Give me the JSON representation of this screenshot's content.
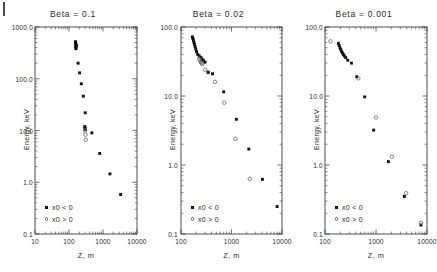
{
  "figure": {
    "panel_count": 3,
    "background": "#ffffff",
    "marker_colors": {
      "filled": "#111111",
      "open": "#5a5a5a"
    }
  },
  "chart_data": [
    {
      "type": "scatter",
      "title": "Beta = 0.1",
      "xlabel": "Z, m",
      "ylabel": "Energy, keV",
      "xscale": "log",
      "yscale": "log",
      "xlim": [
        10,
        10000
      ],
      "ylim": [
        0.1,
        1000.0
      ],
      "xticks": [
        10,
        100,
        1000,
        10000
      ],
      "xticklabels": [
        "10",
        "100",
        "1000",
        "10000"
      ],
      "yticks": [
        0.1,
        1.0,
        10.0,
        100.0,
        1000.0
      ],
      "yticklabels": [
        "0.1",
        "1.0",
        "10.0",
        "100.0",
        "1000.0"
      ],
      "grid": false,
      "legend_position": "lower left",
      "series": [
        {
          "name": "x0 < 0",
          "marker": "filled-square",
          "points": [
            [
              155,
              520
            ],
            [
              158,
              480
            ],
            [
              160,
              450
            ],
            [
              157,
              420
            ],
            [
              162,
              400
            ],
            [
              159,
              380
            ],
            [
              165,
              440
            ],
            [
              156,
              500
            ],
            [
              185,
              200
            ],
            [
              205,
              130
            ],
            [
              230,
              80
            ],
            [
              265,
              46
            ],
            [
              300,
              22
            ],
            [
              290,
              12
            ],
            [
              295,
              11
            ],
            [
              300,
              10.5
            ],
            [
              470,
              9.0
            ],
            [
              800,
              3.6
            ],
            [
              1600,
              1.45
            ],
            [
              3300,
              0.58
            ]
          ]
        },
        {
          "name": "x0 > 0",
          "marker": "open-circle",
          "points": [
            [
              295,
              11.5
            ],
            [
              298,
              10.0
            ],
            [
              305,
              8.3
            ],
            [
              312,
              6.6
            ]
          ]
        }
      ]
    },
    {
      "type": "scatter",
      "title": "Beta = 0.02",
      "xlabel": "Z, m",
      "ylabel": "Energy, keV",
      "xscale": "log",
      "yscale": "log",
      "xlim": [
        100,
        10000
      ],
      "ylim": [
        0.1,
        100.0
      ],
      "xticks": [
        100,
        1000,
        10000
      ],
      "xticklabels": [
        "100",
        "1000",
        "10000"
      ],
      "yticks": [
        0.1,
        1.0,
        10.0,
        100.0
      ],
      "yticklabels": [
        "0.1",
        "1.0",
        "10.0",
        "100.0"
      ],
      "grid": false,
      "legend_position": "lower left",
      "series": [
        {
          "name": "x0 < 0",
          "marker": "filled-square",
          "points": [
            [
              168,
              72
            ],
            [
              172,
              68
            ],
            [
              176,
              64
            ],
            [
              180,
              60
            ],
            [
              185,
              56
            ],
            [
              190,
              52
            ],
            [
              196,
              48
            ],
            [
              203,
              44
            ],
            [
              215,
              40
            ],
            [
              230,
              38
            ],
            [
              250,
              36
            ],
            [
              258,
              34
            ],
            [
              277,
              33
            ],
            [
              300,
              31
            ],
            [
              350,
              22
            ],
            [
              420,
              21
            ],
            [
              700,
              11.5
            ],
            [
              1250,
              4.6
            ],
            [
              2200,
              1.7
            ],
            [
              4100,
              0.62
            ],
            [
              8000,
              0.25
            ]
          ]
        },
        {
          "name": "x0 > 0",
          "marker": "open-circle",
          "points": [
            [
              230,
              35
            ],
            [
              238,
              33
            ],
            [
              246,
              31
            ],
            [
              255,
              30
            ],
            [
              265,
              29
            ],
            [
              300,
              24
            ],
            [
              340,
              22
            ],
            [
              470,
              16
            ],
            [
              720,
              8.0
            ],
            [
              1200,
              2.4
            ],
            [
              2300,
              0.63
            ]
          ]
        }
      ]
    },
    {
      "type": "scatter",
      "title": "Beta = 0.001",
      "xlabel": "Z, m",
      "ylabel": "Energy, keV",
      "xscale": "log",
      "yscale": "log",
      "xlim": [
        100,
        10000
      ],
      "ylim": [
        0.1,
        100.0
      ],
      "xticks": [
        100,
        1000,
        10000
      ],
      "xticklabels": [
        "100",
        "1000",
        "10000"
      ],
      "yticks": [
        0.1,
        1.0,
        10.0,
        100.0
      ],
      "yticklabels": [
        "0.1",
        "1.0",
        "10.0",
        "100.0"
      ],
      "grid": false,
      "legend_position": "lower left",
      "series": [
        {
          "name": "x0 < 0",
          "marker": "filled-square",
          "points": [
            [
              183,
              58
            ],
            [
              190,
              54
            ],
            [
              197,
              50
            ],
            [
              204,
              47
            ],
            [
              212,
              44
            ],
            [
              220,
              42
            ],
            [
              229,
              40
            ],
            [
              240,
              38
            ],
            [
              255,
              36
            ],
            [
              280,
              33
            ],
            [
              330,
              30
            ],
            [
              420,
              19
            ],
            [
              600,
              9.7
            ],
            [
              900,
              3.2
            ],
            [
              1750,
              1.12
            ],
            [
              3600,
              0.35
            ],
            [
              7600,
              0.135
            ]
          ]
        },
        {
          "name": "x0 > 0",
          "marker": "open-circle",
          "points": [
            [
              128,
              62
            ],
            [
              450,
              18
            ],
            [
              1000,
              4.9
            ],
            [
              2050,
              1.32
            ],
            [
              3900,
              0.39
            ],
            [
              7600,
              0.145
            ]
          ]
        }
      ]
    }
  ]
}
